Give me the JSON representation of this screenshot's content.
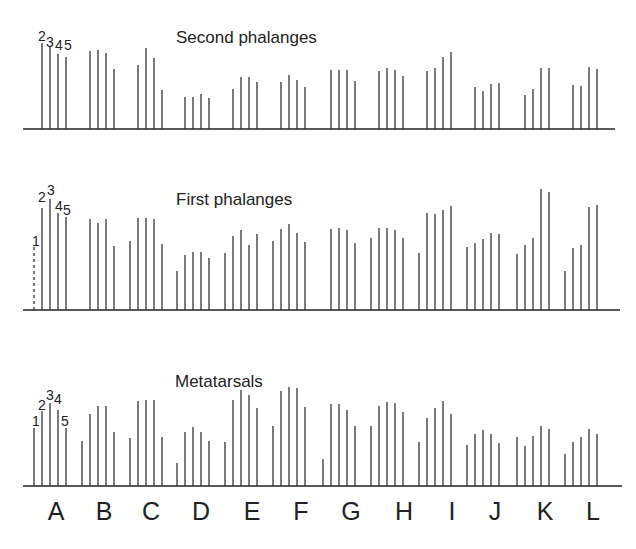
{
  "chart_data": {
    "type": "bar",
    "title": "",
    "xlabel": "",
    "ylabel": "",
    "grid": false,
    "legend": "none",
    "categories": [
      "A",
      "B",
      "C",
      "D",
      "E",
      "F",
      "G",
      "H",
      "I",
      "J",
      "K",
      "L"
    ],
    "panels": [
      {
        "name": "Second phalanges",
        "series_labels": [
          "2",
          "3",
          "4",
          "5"
        ],
        "values": [
          [
            86,
            82,
            75,
            72
          ],
          [
            78,
            79,
            76,
            60
          ],
          [
            64,
            81,
            71,
            39
          ],
          [
            32,
            32,
            35,
            31
          ],
          [
            40,
            52,
            52,
            47
          ],
          [
            47,
            54,
            49,
            42
          ],
          [
            59,
            59,
            59,
            48
          ],
          [
            58,
            61,
            59,
            53
          ],
          [
            58,
            61,
            72,
            77
          ],
          [
            42,
            38,
            45,
            46
          ],
          [
            34,
            40,
            61,
            61
          ],
          [
            44,
            43,
            62,
            60
          ]
        ]
      },
      {
        "name": "First phalanges",
        "series_labels": [
          "1",
          "2",
          "3",
          "4",
          "5"
        ],
        "values": [
          [
            66,
            102,
            111,
            97,
            93
          ],
          [
            91,
            87,
            91,
            64
          ],
          [
            69,
            92,
            92,
            91,
            66
          ],
          [
            39,
            55,
            58,
            58,
            52
          ],
          [
            57,
            74,
            80,
            65,
            76
          ],
          [
            69,
            81,
            86,
            77,
            68
          ],
          [
            81,
            82,
            80,
            67
          ],
          [
            72,
            82,
            82,
            80,
            72
          ],
          [
            57,
            97,
            96,
            100,
            104
          ],
          [
            63,
            67,
            71,
            77,
            76
          ],
          [
            56,
            65,
            72,
            121,
            118
          ],
          [
            39,
            62,
            65,
            103,
            105
          ]
        ]
      },
      {
        "name": "Metatarsals",
        "series_labels": [
          "1",
          "2",
          "3",
          "4",
          "5"
        ],
        "values": [
          [
            58,
            75,
            83,
            76,
            58
          ],
          [
            45,
            72,
            80,
            80,
            54
          ],
          [
            48,
            85,
            86,
            86,
            49
          ],
          [
            23,
            54,
            59,
            54,
            45
          ],
          [
            44,
            86,
            96,
            91,
            78
          ],
          [
            60,
            95,
            99,
            98,
            79
          ],
          [
            27,
            82,
            82,
            76,
            60
          ],
          [
            60,
            80,
            84,
            83,
            74
          ],
          [
            44,
            68,
            78,
            85,
            72
          ],
          [
            41,
            52,
            56,
            52,
            43
          ],
          [
            49,
            40,
            50,
            60,
            57
          ],
          [
            32,
            44,
            49,
            57,
            52
          ]
        ]
      }
    ],
    "ylim": [
      0,
      130
    ]
  },
  "labels": {
    "panel_titles": [
      "Second phalanges",
      "First phalanges",
      "Metatarsals"
    ],
    "top_digits": "2345",
    "categories": [
      "A",
      "B",
      "C",
      "D",
      "E",
      "F",
      "G",
      "H",
      "I",
      "J",
      "K",
      "L"
    ]
  }
}
